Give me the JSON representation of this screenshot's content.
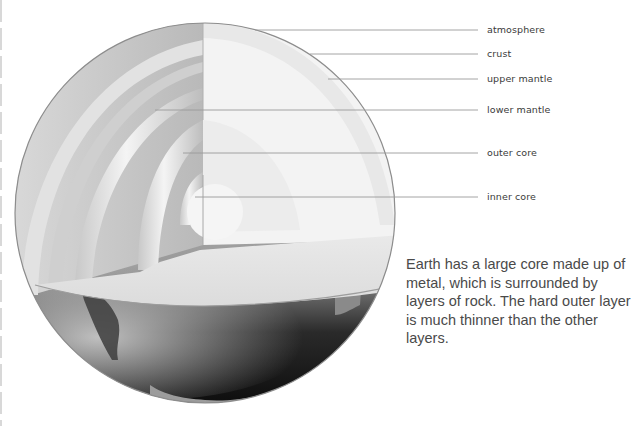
{
  "diagram": {
    "labels": [
      {
        "id": "atmosphere",
        "text": "atmosphere",
        "y": 30,
        "line_x1": 255
      },
      {
        "id": "crust",
        "text": "crust",
        "y": 54,
        "line_x1": 310
      },
      {
        "id": "upper-mantle",
        "text": "upper mantle",
        "y": 79,
        "line_x1": 328
      },
      {
        "id": "lower-mantle",
        "text": "lower mantle",
        "y": 110,
        "line_x1": 155
      },
      {
        "id": "outer-core",
        "text": "outer core",
        "y": 153,
        "line_x1": 183
      },
      {
        "id": "inner-core",
        "text": "inner core",
        "y": 197,
        "line_x1": 195
      }
    ],
    "leader_line_x2": 478,
    "leader_line_color": "#9a9a9a",
    "caption": "Earth has a large core made up of metal, which is surrounded by layers of rock. The hard outer layer is much thinner than the other layers."
  },
  "labels": {
    "atmosphere": "atmosphere",
    "crust": "crust",
    "upper_mantle": "upper mantle",
    "lower_mantle": "lower mantle",
    "outer_core": "outer core",
    "inner_core": "inner core"
  },
  "caption": "Earth has a large core made up of metal, which is surrounded by layers of rock. The hard outer layer is much thinner than the other layers."
}
